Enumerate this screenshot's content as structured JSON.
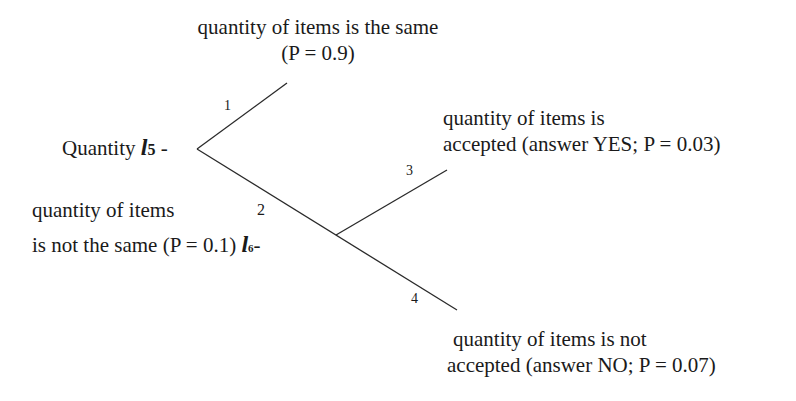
{
  "diagram": {
    "type": "probability-tree",
    "root": {
      "label": "Quantity",
      "var": "l",
      "sub": "5",
      "suffix": " -"
    },
    "branches": [
      {
        "number": "1",
        "label_line1": "quantity of items is the same",
        "label_line2": "(P = 0.9)"
      },
      {
        "number": "2",
        "label_line1": "quantity of items",
        "label_line2": "is not the same (P = 0.1)",
        "node_var": "l",
        "node_sub": "6",
        "node_suffix": "-"
      },
      {
        "number": "3",
        "label_line1": "quantity of items is",
        "label_line2": "accepted (answer YES; P = 0.03)"
      },
      {
        "number": "4",
        "label_line1": "quantity of items is not",
        "label_line2": "accepted (answer NO; P = 0.07)"
      }
    ],
    "line_color": "#2a2a2a"
  }
}
